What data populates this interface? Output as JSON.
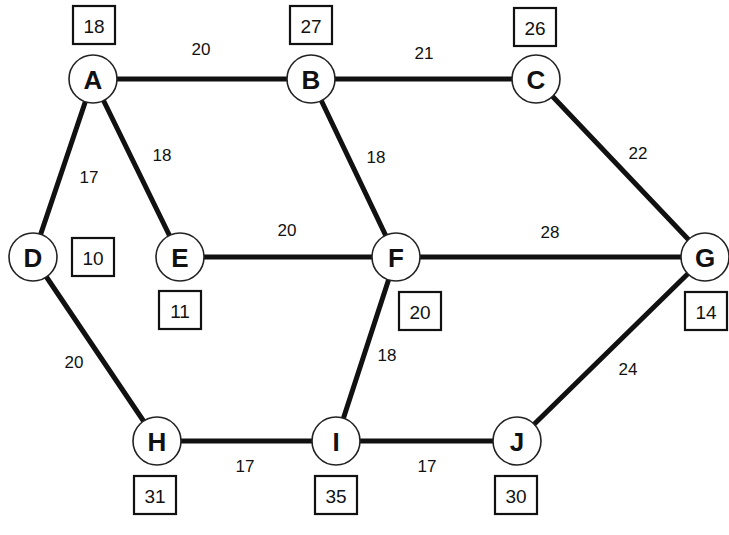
{
  "graph": {
    "nodes": [
      {
        "id": "A",
        "label": "A",
        "x": 93,
        "y": 79,
        "value": "18",
        "box_x": 94,
        "box_y": 25
      },
      {
        "id": "B",
        "label": "B",
        "x": 311,
        "y": 79,
        "value": "27",
        "box_x": 311,
        "box_y": 25
      },
      {
        "id": "C",
        "label": "C",
        "x": 536,
        "y": 79,
        "value": "26",
        "box_x": 535,
        "box_y": 27
      },
      {
        "id": "D",
        "label": "D",
        "x": 33,
        "y": 257,
        "value": "10",
        "box_x": 93,
        "box_y": 257
      },
      {
        "id": "E",
        "label": "E",
        "x": 180,
        "y": 257,
        "value": "11",
        "box_x": 180,
        "box_y": 310
      },
      {
        "id": "F",
        "label": "F",
        "x": 396,
        "y": 257,
        "value": "20",
        "box_x": 420,
        "box_y": 311
      },
      {
        "id": "G",
        "label": "G",
        "x": 705,
        "y": 257,
        "value": "14",
        "box_x": 706,
        "box_y": 311
      },
      {
        "id": "H",
        "label": "H",
        "x": 157,
        "y": 441,
        "value": "31",
        "box_x": 155,
        "box_y": 495
      },
      {
        "id": "I",
        "label": "I",
        "x": 336,
        "y": 441,
        "value": "35",
        "box_x": 336,
        "box_y": 495
      },
      {
        "id": "J",
        "label": "J",
        "x": 517,
        "y": 441,
        "value": "30",
        "box_x": 516,
        "box_y": 495
      }
    ],
    "edges": [
      {
        "from": "A",
        "to": "B",
        "weight": "20",
        "label_x": 201,
        "label_y": 49
      },
      {
        "from": "B",
        "to": "C",
        "weight": "21",
        "label_x": 424,
        "label_y": 53
      },
      {
        "from": "A",
        "to": "D",
        "weight": "17",
        "label_x": 89,
        "label_y": 177
      },
      {
        "from": "A",
        "to": "E",
        "weight": "18",
        "label_x": 162,
        "label_y": 155
      },
      {
        "from": "B",
        "to": "F",
        "weight": "18",
        "label_x": 376,
        "label_y": 157
      },
      {
        "from": "C",
        "to": "G",
        "weight": "22",
        "label_x": 638,
        "label_y": 153
      },
      {
        "from": "E",
        "to": "F",
        "weight": "20",
        "label_x": 287,
        "label_y": 230
      },
      {
        "from": "F",
        "to": "G",
        "weight": "28",
        "label_x": 550,
        "label_y": 232
      },
      {
        "from": "D",
        "to": "H",
        "weight": "20",
        "label_x": 74,
        "label_y": 362
      },
      {
        "from": "F",
        "to": "I",
        "weight": "18",
        "label_x": 387,
        "label_y": 355
      },
      {
        "from": "G",
        "to": "J",
        "weight": "24",
        "label_x": 628,
        "label_y": 369
      },
      {
        "from": "H",
        "to": "I",
        "weight": "17",
        "label_x": 245,
        "label_y": 466
      },
      {
        "from": "I",
        "to": "J",
        "weight": "17",
        "label_x": 427,
        "label_y": 466
      }
    ]
  },
  "style": {
    "line_color": "#111111",
    "background": "#ffffff",
    "node_radius": 24,
    "box_width": 42,
    "box_height": 38
  }
}
